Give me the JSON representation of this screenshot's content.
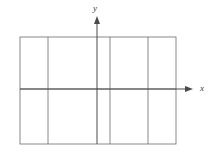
{
  "figure": {
    "kind": "coordinate-axes-diagram",
    "background_color": "#ffffff",
    "canvas": {
      "width": 215,
      "height": 160
    },
    "line_color": "#6b6b6b",
    "axis_color": "#4a4a4a",
    "line_width": 0.8,
    "axis_width": 1.0
  },
  "axes": {
    "x_axis": {
      "label": "x",
      "label_style": "italic",
      "label_x": 200,
      "label_y": 84,
      "y": 89,
      "x_start": 20,
      "x_end": 193,
      "arrow": "right",
      "arrow_tip_x": 193,
      "arrow_size": 5
    },
    "y_axis": {
      "label": "y",
      "label_style": "italic",
      "label_x": 93,
      "label_y": 4,
      "x": 97,
      "y_start": 144,
      "y_end": 16,
      "arrow": "up",
      "arrow_tip_y": 16,
      "arrow_size": 5
    }
  },
  "rectangle": {
    "left": 20,
    "right": 176,
    "top": 37,
    "bottom": 144,
    "width": 156,
    "height": 107
  },
  "grid": {
    "vertical_lines": [
      48,
      110,
      148
    ],
    "horizontal_lines": [
      89
    ],
    "vertical_line_count": 3,
    "horizontal_line_count": 1,
    "cell_columns": 5,
    "cell_rows": 2
  },
  "column_boundaries": [
    20,
    48,
    97,
    110,
    148,
    176
  ],
  "row_boundaries": [
    37,
    89,
    144
  ]
}
